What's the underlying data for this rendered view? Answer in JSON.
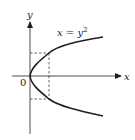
{
  "figure": {
    "type": "parabola-graph",
    "equation_label": {
      "lhs": "x",
      "eq": " = ",
      "base": "y",
      "exp": "2"
    },
    "axes": {
      "x_label": "x",
      "y_label": "y",
      "origin_label": "0"
    },
    "curve": {
      "equation": "x = y^2",
      "orientation": "opens-right",
      "vertex": [
        0,
        0
      ]
    },
    "guides": {
      "style": "dashed",
      "description": "dashed lines marking a point on the upper and lower branches with same x-value"
    },
    "colors": {
      "stroke": "#231f20",
      "background": "#ffffff"
    }
  }
}
